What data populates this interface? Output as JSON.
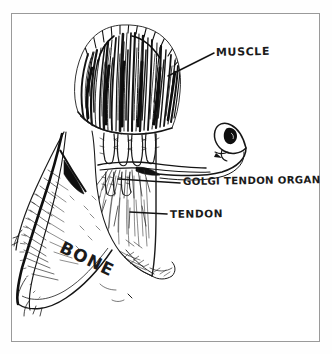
{
  "figure": {
    "kind": "hand-drawn-anatomical-illustration",
    "style": "black ink pen-and-hatching line drawing on white paper",
    "border_color": "#9a9a9a",
    "ink_color": "#1b1b1b",
    "paper_color": "#ffffff"
  },
  "labels": {
    "muscle": "MUSCLE",
    "golgi_tendon_organ": "GOLGI TENDON ORGAN",
    "tendon": "TENDON",
    "bone": "BONE"
  },
  "structures": [
    {
      "name": "muscle",
      "label": "MUSCLE",
      "description": "dense vertical ink hatching forming the muscle belly at the top, fibers converging downward"
    },
    {
      "name": "muscle-tendon-junction",
      "label": "",
      "description": "finger-like collagen bundle projections where muscle fibers insert into the tendon"
    },
    {
      "name": "golgi-tendon-organ",
      "label": "GOLGI TENDON ORGAN",
      "description": "encapsulated spindle-shaped receptor woven among collagen bundles with a nerve fiber looping out to the right and ending in a dark cell body"
    },
    {
      "name": "tendon",
      "label": "TENDON",
      "description": "pale fan of fine radiating hatch lines running from the junction down to the bone"
    },
    {
      "name": "bone",
      "label": "BONE",
      "description": "long shaded shaft sloping down-left with cross-hatched periosteal shading and a dark wedge of attachment"
    },
    {
      "name": "nerve-fiber",
      "label": "",
      "description": "afferent axon leaving the Golgi tendon organ, curving right and up into a closed loop"
    }
  ],
  "leader_lines": [
    {
      "for": "MUSCLE",
      "from": [
        214,
        53
      ],
      "to": [
        168,
        75
      ],
      "style": "diagonal"
    },
    {
      "for": "GOLGI TENDON ORGAN",
      "from": [
        180,
        183
      ],
      "to": [
        118,
        179
      ],
      "style": "horizontal"
    },
    {
      "for": "TENDON",
      "from": [
        167,
        214
      ],
      "to": [
        130,
        212
      ],
      "style": "horizontal"
    }
  ]
}
